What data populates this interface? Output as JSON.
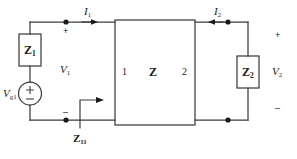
{
  "diagram": {
    "stroke_color": "#3d3d3d",
    "text_color": "#1a1a1a",
    "background": "#ffffff"
  },
  "source": {
    "label_v": "V",
    "label_sub": "g1",
    "plus": "+",
    "minus": "–"
  },
  "series_impedance": {
    "label_z": "Z",
    "label_sub": "1"
  },
  "load_impedance": {
    "label_z": "Z",
    "label_sub": "2"
  },
  "twoport": {
    "port1_label": "1",
    "network_label": "Z",
    "port2_label": "2"
  },
  "currents": {
    "i1": {
      "label": "I",
      "sub": "1",
      "direction": "right"
    },
    "i2": {
      "label": "I",
      "sub": "2",
      "direction": "left"
    }
  },
  "voltages": {
    "v1": {
      "label": "V",
      "sub": "1",
      "plus": "+",
      "minus": "–"
    },
    "v2": {
      "label": "V",
      "sub": "2",
      "plus": "+",
      "minus": "–"
    }
  },
  "input_impedance": {
    "label": "Z",
    "sub": "11"
  }
}
